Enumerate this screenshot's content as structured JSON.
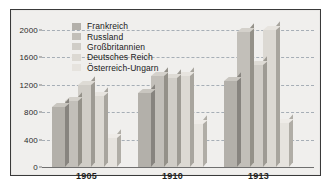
{
  "chart_data": {
    "type": "bar",
    "title": "",
    "subtitle": "",
    "xlabel": "",
    "ylabel": "",
    "categories": [
      "1905",
      "1910",
      "1913"
    ],
    "ylim": [
      0,
      2200
    ],
    "yticks": [
      0,
      400,
      800,
      1200,
      1600,
      2000
    ],
    "ytick_labels": [
      "0",
      "400",
      "800",
      "1200",
      "1600",
      "2000"
    ],
    "grid": true,
    "grid_style": "dashed-horizontal",
    "legend_position": "top-left-inside",
    "orientation": "vertical-grouped-3d",
    "series": [
      {
        "name": "Frankreich",
        "color": "#b3b0aa",
        "values": [
          880,
          1080,
          1250
        ]
      },
      {
        "name": "Russland",
        "color": "#c2bfb9",
        "values": [
          960,
          1320,
          1960
        ]
      },
      {
        "name": "Großbritannien",
        "color": "#d0cdc7",
        "values": [
          1200,
          1290,
          1480
        ]
      },
      {
        "name": "Deutsches Reich",
        "color": "#dcd9d3",
        "values": [
          1040,
          1320,
          1990
        ]
      },
      {
        "name": "Österreich-Ungarn",
        "color": "#e6e3de",
        "values": [
          420,
          620,
          640
        ]
      }
    ],
    "annotations": []
  },
  "legend": {
    "items": [
      {
        "label": "Frankreich"
      },
      {
        "label": "Russland"
      },
      {
        "label": "Großbritannien"
      },
      {
        "label": "Deutsches Reich"
      },
      {
        "label": "Österreich-Ungarn"
      }
    ]
  },
  "axes": {
    "y": {
      "ticks": [
        "2000",
        "1600",
        "1200",
        "800",
        "400",
        "0"
      ]
    },
    "x": {
      "groups": [
        "1905",
        "1910",
        "1913"
      ]
    }
  }
}
